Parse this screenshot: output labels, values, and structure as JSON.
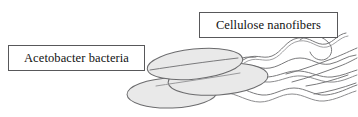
{
  "figure": {
    "background_color": "#ffffff",
    "width": 358,
    "height": 117
  },
  "labels": {
    "cellulose": {
      "text": "Cellulose nanofibers",
      "box_border_color": "#58585a",
      "box_fill_color": "#ffffff",
      "text_color": "#111111"
    },
    "acetobacter": {
      "text": "Acetobacter bacteria",
      "box_border_color": "#58585a",
      "box_fill_color": "#ffffff",
      "text_color": "#111111"
    }
  },
  "artwork": {
    "bacteria_fill_color": "#e8e8e8",
    "bacteria_stroke_color": "#6b6b6d",
    "fiber_stroke_color": "#7a7a7c",
    "bacteria_count": 3,
    "bacteria_cells": [
      {
        "name": "bacterium-upper",
        "cx": 195,
        "cy": 64,
        "rx": 48,
        "ry": 15,
        "rotation": -6
      },
      {
        "name": "bacterium-middle",
        "cx": 218,
        "cy": 79,
        "rx": 50,
        "ry": 16,
        "rotation": -4
      },
      {
        "name": "bacterium-lower",
        "cx": 172,
        "cy": 93,
        "rx": 45,
        "ry": 15,
        "rotation": -2
      }
    ],
    "fiber_count": 7,
    "fiber_description": "wavy hand-drawn cellulose nanofibers extending to the right from the bacterial cells"
  }
}
